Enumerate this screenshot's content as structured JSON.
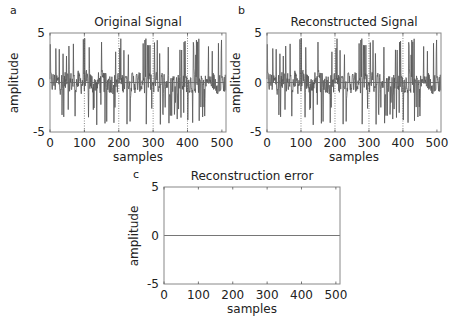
{
  "chart_data": [
    {
      "panel": "a",
      "type": "line",
      "title": "Original Signal",
      "xlabel": "samples",
      "ylabel": "amplitude",
      "xlim": [
        0,
        512
      ],
      "ylim": [
        -5,
        5
      ],
      "xticks": [
        0,
        100,
        200,
        300,
        400,
        500
      ],
      "yticks": [
        5,
        0,
        -5
      ],
      "grid": "vertical dotted at 100,200,300,400",
      "description": "Noisy random signal, 512 samples, amplitude mostly within [-4.5, 4.5] with spikes",
      "series": [
        {
          "name": "original",
          "n_samples": 512,
          "range": [
            -4.5,
            4.5
          ]
        }
      ]
    },
    {
      "panel": "b",
      "type": "line",
      "title": "Reconstructed Signal",
      "xlabel": "samples",
      "ylabel": "amplitude",
      "xlim": [
        0,
        512
      ],
      "ylim": [
        -5,
        5
      ],
      "xticks": [
        0,
        100,
        200,
        300,
        400,
        500
      ],
      "yticks": [
        5,
        0,
        -5
      ],
      "grid": "vertical dotted at 100,200,300,400",
      "description": "Identical to original signal (perfect reconstruction)",
      "series": [
        {
          "name": "reconstructed",
          "n_samples": 512,
          "range": [
            -4.5,
            4.5
          ]
        }
      ]
    },
    {
      "panel": "c",
      "type": "line",
      "title": "Reconstruction error",
      "xlabel": "samples",
      "ylabel": "amplitude",
      "xlim": [
        0,
        512
      ],
      "ylim": [
        -5,
        5
      ],
      "xticks": [
        0,
        100,
        200,
        300,
        400,
        500
      ],
      "yticks": [
        5,
        0,
        -5
      ],
      "grid": "off",
      "series": [
        {
          "name": "error",
          "n_samples": 512,
          "values_constant": 0
        }
      ]
    }
  ],
  "panels": {
    "a": {
      "letter": "a",
      "title": "Original Signal",
      "xlabel": "samples",
      "ylabel": "amplitude"
    },
    "b": {
      "letter": "b",
      "title": "Reconstructed Signal",
      "xlabel": "samples",
      "ylabel": "amplitude"
    },
    "c": {
      "letter": "c",
      "title": "Reconstruction error",
      "xlabel": "samples",
      "ylabel": "amplitude"
    }
  },
  "ticks": {
    "x": [
      "0",
      "100",
      "200",
      "300",
      "400",
      "500"
    ],
    "y": [
      "5",
      "0",
      "-5"
    ]
  },
  "colors": {
    "signal": "#555555",
    "axis": "#888888",
    "zero_line": "#666666"
  }
}
